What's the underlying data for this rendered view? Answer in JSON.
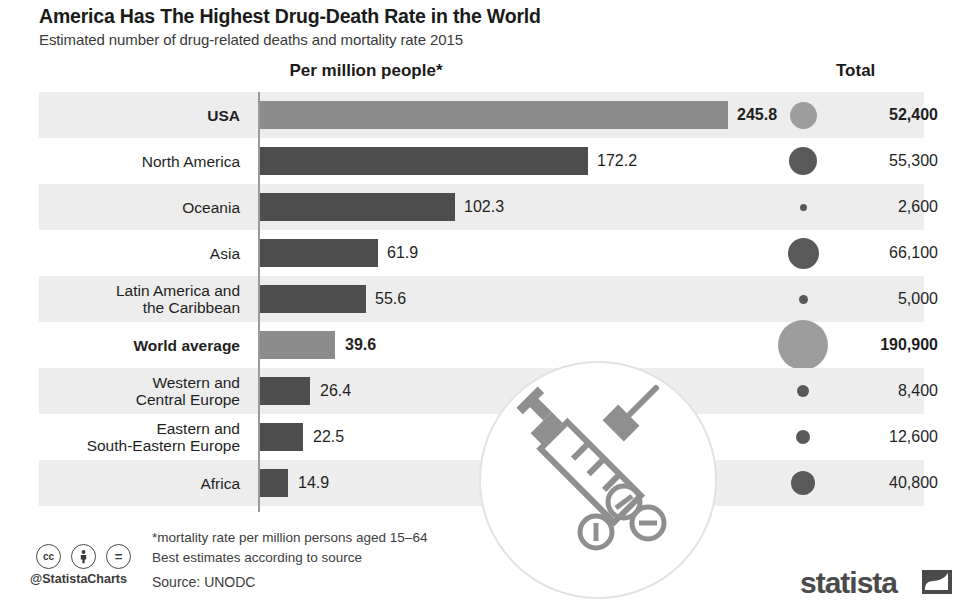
{
  "header": {
    "title": "America Has The Highest Drug-Death Rate in the World",
    "subtitle": "Estimated number of drug-related deaths and mortality rate 2015",
    "left_column_header": "Per million people*",
    "right_column_header": "Total"
  },
  "footer": {
    "footnote_line1": "*mortality rate per million persons aged 15–64",
    "footnote_line2": "Best estimates according to source",
    "source": "Source: UNODC",
    "handle": "@StatistaCharts",
    "cc_badges": [
      "cc",
      "person",
      "="
    ],
    "brand": "statista"
  },
  "colors": {
    "bar_default": "#4d4d4d",
    "bar_highlight": "#8c8c8c",
    "bubble_default": "#595959",
    "bubble_highlight": "#9d9d9d",
    "row_shade": "#ededed",
    "axis": "#9a9a9a",
    "text": "#1f1f1f"
  },
  "chart_data": {
    "type": "bar",
    "title": "America Has The Highest Drug-Death Rate in the World",
    "subtitle": "Estimated number of drug-related deaths and mortality rate 2015",
    "xlabel": "Per million people*",
    "ylabel": "",
    "orientation": "horizontal",
    "grid": false,
    "legend": "none",
    "xlim": [
      0,
      245.8
    ],
    "categories": [
      "USA",
      "North America",
      "Oceania",
      "Asia",
      "Latin America and\nthe Caribbean",
      "World average",
      "Western and\nCentral Europe",
      "Eastern and\nSouth-Eastern Europe",
      "Africa"
    ],
    "values": [
      245.8,
      172.2,
      102.3,
      61.9,
      55.6,
      39.6,
      26.4,
      22.5,
      14.9
    ],
    "value_labels": [
      "245.8",
      "172.2",
      "102.3",
      "61.9",
      "55.6",
      "39.6",
      "26.4",
      "22.5",
      "14.9"
    ],
    "totals": [
      52400,
      55300,
      2600,
      66100,
      5000,
      190900,
      8400,
      12600,
      40800
    ],
    "total_labels": [
      "52,400",
      "55,300",
      "2,600",
      "66,100",
      "5,000",
      "190,900",
      "8,400",
      "12,600",
      "40,800"
    ],
    "series": [
      {
        "name": "Mortality rate per million people",
        "values": [
          245.8,
          172.2,
          102.3,
          61.9,
          55.6,
          39.6,
          26.4,
          22.5,
          14.9
        ]
      },
      {
        "name": "Total drug-related deaths",
        "values": [
          52400,
          55300,
          2600,
          66100,
          5000,
          190900,
          8400,
          12600,
          40800
        ]
      }
    ],
    "highlighted": [
      "USA",
      "World average"
    ]
  },
  "rows": [
    {
      "category": "USA",
      "value_label": "245.8",
      "total_label": "52,400",
      "bar_px": 468,
      "bubble_px": 27,
      "shaded": true,
      "highlight": true,
      "value_x": 737,
      "label_lines": 1
    },
    {
      "category": "North America",
      "value_label": "172.2",
      "total_label": "55,300",
      "bar_px": 328,
      "bubble_px": 28,
      "shaded": false,
      "highlight": false,
      "value_x": 597,
      "label_lines": 1
    },
    {
      "category": "Oceania",
      "value_label": "102.3",
      "total_label": "2,600",
      "bar_px": 195,
      "bubble_px": 7,
      "shaded": true,
      "highlight": false,
      "value_x": 464,
      "label_lines": 1
    },
    {
      "category": "Asia",
      "value_label": "61.9",
      "total_label": "66,100",
      "bar_px": 118,
      "bubble_px": 31,
      "shaded": false,
      "highlight": false,
      "value_x": 387,
      "label_lines": 1
    },
    {
      "category": "Latin America and\nthe Caribbean",
      "value_label": "55.6",
      "total_label": "5,000",
      "bar_px": 106,
      "bubble_px": 9,
      "shaded": true,
      "highlight": false,
      "value_x": 375,
      "label_lines": 2
    },
    {
      "category": "World average",
      "value_label": "39.6",
      "total_label": "190,900",
      "bar_px": 75,
      "bubble_px": 50,
      "shaded": false,
      "highlight": true,
      "value_x": 345,
      "label_lines": 1
    },
    {
      "category": "Western and\nCentral Europe",
      "value_label": "26.4",
      "total_label": "8,400",
      "bar_px": 50,
      "bubble_px": 12,
      "shaded": true,
      "highlight": false,
      "value_x": 320,
      "label_lines": 2
    },
    {
      "category": "Eastern and\nSouth-Eastern Europe",
      "value_label": "22.5",
      "total_label": "12,600",
      "bar_px": 43,
      "bubble_px": 14,
      "shaded": false,
      "highlight": false,
      "value_x": 313,
      "label_lines": 2
    },
    {
      "category": "Africa",
      "value_label": "14.9",
      "total_label": "40,800",
      "bar_px": 28,
      "bubble_px": 24,
      "shaded": true,
      "highlight": false,
      "value_x": 298,
      "label_lines": 1
    }
  ]
}
